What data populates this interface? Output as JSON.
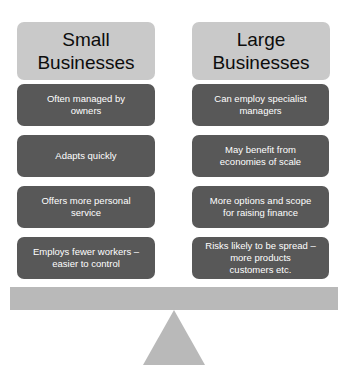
{
  "diagram": {
    "colors": {
      "header_fill": "#c9c9c9",
      "point_fill": "#585858",
      "point_text": "#ffffff",
      "beam_fill": "#b9b9b9",
      "fulcrum_fill": "#b9b9b9",
      "background": "#ffffff"
    },
    "columns": [
      {
        "id": "small-businesses",
        "header": "Small\nBusinesses",
        "points": [
          "Often managed by\nowners",
          "Adapts quickly",
          "Offers more personal\nservice",
          "Employs fewer workers –\neasier to control"
        ]
      },
      {
        "id": "large-businesses",
        "header": "Large\nBusinesses",
        "points": [
          "Can employ specialist\nmanagers",
          "May benefit from\neconomies of scale",
          "More options and scope\nfor raising finance",
          "Risks likely to be spread –\nmore products\ncustomers etc."
        ]
      }
    ],
    "balance": {
      "beam_label": "balance-beam",
      "fulcrum_label": "balance-fulcrum"
    }
  }
}
